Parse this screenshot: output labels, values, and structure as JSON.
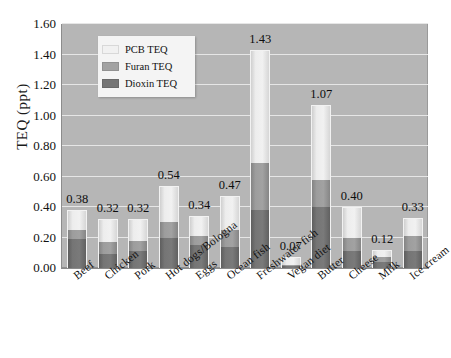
{
  "chart_data": {
    "type": "bar",
    "subtype": "stacked-vertical",
    "title": "",
    "xlabel": "",
    "ylabel": "TEQ  (ppt)",
    "ylim": [
      0.0,
      1.6
    ],
    "ytick_step": 0.2,
    "ytick_labels": [
      "1.60",
      "1.40",
      "1.20",
      "1.00",
      "0.80",
      "0.60",
      "0.40",
      "0.20",
      "0.00"
    ],
    "ytick_values": [
      1.6,
      1.4,
      1.2,
      1.0,
      0.8,
      0.6,
      0.4,
      0.2,
      0.0
    ],
    "grid": "horizontal",
    "plot_background": "#b6b6b6",
    "legend_position": "inside-upper-left",
    "categories": [
      "Beef",
      "Chicken",
      "Pork",
      "Hot dogs/Bologna",
      "Eggs",
      "Ocean fish",
      "Freshwater fish",
      "Vegan diet",
      "Butter",
      "Cheese",
      "Milk",
      "Ice cream"
    ],
    "totals": [
      0.38,
      0.32,
      0.32,
      0.54,
      0.34,
      0.47,
      1.43,
      0.07,
      1.07,
      0.4,
      0.12,
      0.33
    ],
    "total_labels": [
      "0.38",
      "0.32",
      "0.32",
      "0.54",
      "0.34",
      "0.47",
      "1.43",
      "0.07",
      "1.07",
      "0.40",
      "0.12",
      "0.33"
    ],
    "series": [
      {
        "name": "Dioxin TEQ",
        "color": "#757575",
        "stack_order": 1,
        "values": [
          0.19,
          0.09,
          0.11,
          0.2,
          0.15,
          0.14,
          0.38,
          0.01,
          0.4,
          0.11,
          0.04,
          0.11
        ]
      },
      {
        "name": "Furan TEQ",
        "color": "#a2a2a2",
        "stack_order": 2,
        "values": [
          0.06,
          0.08,
          0.07,
          0.1,
          0.06,
          0.11,
          0.31,
          0.01,
          0.18,
          0.09,
          0.03,
          0.1
        ]
      },
      {
        "name": "PCB TEQ",
        "color": "#f1f1f1",
        "stack_order": 3,
        "values": [
          0.13,
          0.15,
          0.14,
          0.24,
          0.13,
          0.22,
          0.74,
          0.05,
          0.49,
          0.2,
          0.05,
          0.12
        ]
      }
    ]
  },
  "legend": {
    "entries": [
      {
        "label": "PCB TEQ",
        "swatch": "#f1f1f1"
      },
      {
        "label": "Furan TEQ",
        "swatch": "#a2a2a2"
      },
      {
        "label": "Dioxin TEQ",
        "swatch": "#757575"
      }
    ]
  }
}
